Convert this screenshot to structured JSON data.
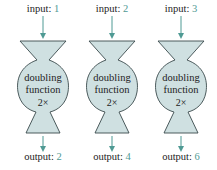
{
  "colors": {
    "fill": "#cfe0e1",
    "stroke": "#3a4a4c",
    "arrow": "#4f9a94",
    "value": "#4f9a94",
    "text": "#222222"
  },
  "machines": [
    {
      "input_label": "input:",
      "input_value": "1",
      "function_line1": "doubling",
      "function_line2": "function",
      "operation": "2×",
      "output_label": "output:",
      "output_value": "2"
    },
    {
      "input_label": "input:",
      "input_value": "2",
      "function_line1": "doubling",
      "function_line2": "function",
      "operation": "2×",
      "output_label": "output:",
      "output_value": "4"
    },
    {
      "input_label": "input:",
      "input_value": "3",
      "function_line1": "doubling",
      "function_line2": "function",
      "operation": "2×",
      "output_label": "output:",
      "output_value": "6"
    }
  ]
}
